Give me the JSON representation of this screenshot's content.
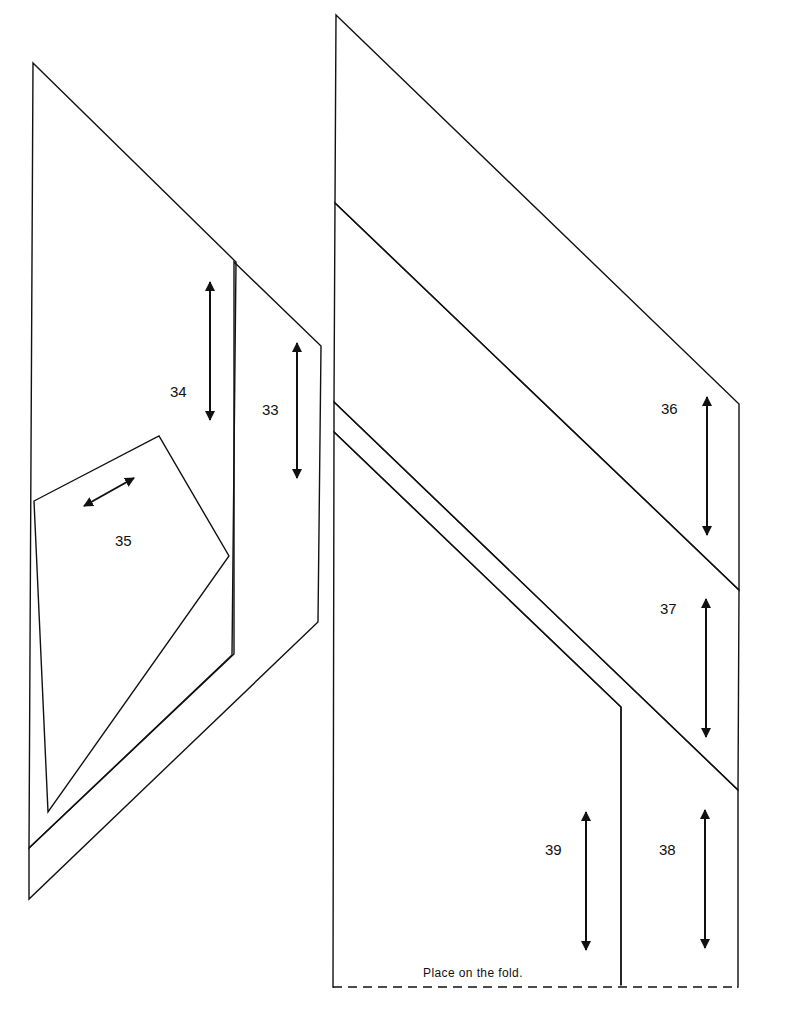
{
  "page": {
    "background": "#ffffff",
    "line_color": "#111111",
    "fold_note": "Place on the fold."
  },
  "pieces": [
    {
      "id": "33",
      "label": "33",
      "outline": [
        [
          234,
          262
        ],
        [
          321,
          346
        ],
        [
          318,
          622
        ],
        [
          29,
          899
        ],
        [
          29,
          848
        ],
        [
          234,
          654
        ]
      ],
      "label_pos": [
        262,
        402
      ],
      "grain": {
        "x1": 297,
        "y1": 343,
        "x2": 297,
        "y2": 478
      }
    },
    {
      "id": "34",
      "label": "34",
      "outline": [
        [
          33,
          63
        ],
        [
          236,
          262
        ],
        [
          232,
          655
        ],
        [
          29,
          848
        ]
      ],
      "label_pos": [
        170,
        384
      ],
      "grain": {
        "x1": 210,
        "y1": 282,
        "x2": 210,
        "y2": 420
      }
    },
    {
      "id": "35",
      "label": "35",
      "outline": [
        [
          34,
          501
        ],
        [
          159,
          436
        ],
        [
          229,
          556
        ],
        [
          48,
          812
        ]
      ],
      "label_pos": [
        115,
        533
      ],
      "grain": {
        "x1": 84,
        "y1": 506,
        "x2": 134,
        "y2": 478
      }
    },
    {
      "id": "36",
      "label": "36",
      "outline": [
        [
          336,
          15
        ],
        [
          739,
          404
        ],
        [
          739,
          590
        ],
        [
          335,
          203
        ]
      ],
      "label_pos": [
        661,
        401
      ],
      "grain": {
        "x1": 707,
        "y1": 397,
        "x2": 707,
        "y2": 535
      }
    },
    {
      "id": "37",
      "label": "37",
      "outline": [
        [
          335,
          203
        ],
        [
          739,
          590
        ],
        [
          738,
          790
        ],
        [
          334,
          402
        ]
      ],
      "label_pos": [
        660,
        601
      ],
      "grain": {
        "x1": 706,
        "y1": 599,
        "x2": 706,
        "y2": 737
      }
    },
    {
      "id": "38",
      "label": "38",
      "outline": [
        [
          334,
          402
        ],
        [
          738,
          790
        ],
        [
          738,
          987
        ],
        [
          621,
          987
        ],
        [
          621,
          707
        ],
        [
          334,
          432
        ]
      ],
      "label_pos": [
        659,
        842
      ],
      "grain": {
        "x1": 705,
        "y1": 810,
        "x2": 705,
        "y2": 948
      }
    },
    {
      "id": "39",
      "label": "39",
      "outline": [
        [
          334,
          432
        ],
        [
          621,
          707
        ],
        [
          621,
          987
        ],
        [
          333,
          987
        ]
      ],
      "label_pos": [
        545,
        842
      ],
      "grain": {
        "x1": 586,
        "y1": 812,
        "x2": 586,
        "y2": 950
      }
    }
  ],
  "fold_line": {
    "x1": 333,
    "y1": 987,
    "x2": 738,
    "y2": 987,
    "note_pos": [
      423,
      966
    ]
  }
}
